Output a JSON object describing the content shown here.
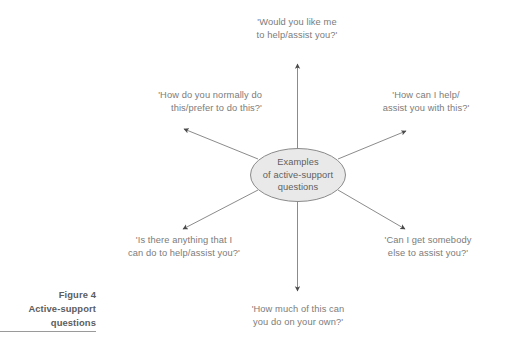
{
  "figure": {
    "caption_lines": [
      "Figure 4",
      "Active-support",
      "questions"
    ],
    "rule": "horizontal-rule"
  },
  "diagram": {
    "type": "radial-spoke",
    "center_node": {
      "shape": "ellipse",
      "fill": "#e9e9e9",
      "stroke": "#8a8a8a",
      "lines": [
        "Examples",
        "of active-support",
        "questions"
      ]
    },
    "spokes": [
      {
        "id": "top",
        "direction": "up",
        "lines": [
          "'Would you like me",
          "to help/assist you?'"
        ]
      },
      {
        "id": "upper-left",
        "direction": "up-left",
        "lines": [
          "'How do you normally do",
          "this/prefer to do this?'"
        ]
      },
      {
        "id": "upper-right",
        "direction": "up-right",
        "lines": [
          "'How can I help/",
          "assist you with this?'"
        ]
      },
      {
        "id": "lower-left",
        "direction": "down-left",
        "lines": [
          "'Is there anything that I",
          "can do to help/assist you?'"
        ]
      },
      {
        "id": "lower-right",
        "direction": "down-right",
        "lines": [
          "'Can I get somebody",
          "else to assist you?'"
        ]
      },
      {
        "id": "bottom",
        "direction": "down",
        "lines": [
          "'How much of this can",
          "you do on your own?'"
        ]
      }
    ],
    "arrow_color": "#555555",
    "text_color": "#7b7b7b"
  }
}
